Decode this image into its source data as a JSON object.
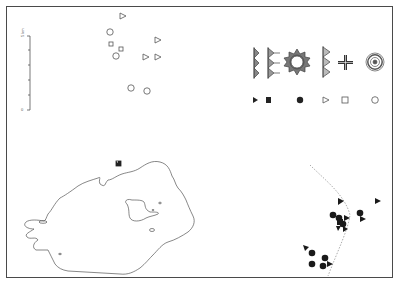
{
  "map": {
    "width": 396,
    "height": 283,
    "colors": {
      "ink": "#333333",
      "outline": "#555555",
      "frame": "#4a4a4a",
      "dashed_line": "#888888",
      "background": "#ffffff"
    },
    "scale_bar": {
      "top_label": "5 km",
      "bottom_label": "0",
      "ticks": 6
    },
    "legend": {
      "motifs": [
        {
          "name": "triangle-chain-single",
          "icon": "motif-triangle-column-icon"
        },
        {
          "name": "triangle-chain-double",
          "icon": "motif-double-triangle-column-icon"
        },
        {
          "name": "sun-rosette",
          "icon": "motif-sun-icon"
        },
        {
          "name": "triangle-chain-outlined",
          "icon": "motif-outlined-triangle-column-icon"
        },
        {
          "name": "cross",
          "icon": "motif-cross-icon"
        },
        {
          "name": "concentric-circles",
          "icon": "motif-concentric-circles-icon"
        }
      ],
      "markers": [
        {
          "symbol": "filled-triangle",
          "icon": "filled-triangle-icon"
        },
        {
          "symbol": "filled-square",
          "icon": "filled-square-icon"
        },
        {
          "symbol": "filled-circle",
          "icon": "filled-circle-icon"
        },
        {
          "symbol": "open-triangle",
          "icon": "open-triangle-icon"
        },
        {
          "symbol": "open-square",
          "icon": "open-square-icon"
        },
        {
          "symbol": "open-circle",
          "icon": "open-circle-icon"
        }
      ]
    },
    "open_points": [
      {
        "type": "triangle",
        "x": 122,
        "y": 16
      },
      {
        "type": "circle",
        "x": 110,
        "y": 32
      },
      {
        "type": "square",
        "x": 111,
        "y": 44
      },
      {
        "type": "square",
        "x": 121,
        "y": 49
      },
      {
        "type": "circle",
        "x": 116,
        "y": 56
      },
      {
        "type": "triangle",
        "x": 157,
        "y": 40
      },
      {
        "type": "triangle",
        "x": 145,
        "y": 57
      },
      {
        "type": "triangle",
        "x": 157,
        "y": 57
      },
      {
        "type": "circle",
        "x": 131,
        "y": 88
      },
      {
        "type": "circle",
        "x": 147,
        "y": 91
      }
    ],
    "filled_points": [
      {
        "type": "triangle",
        "x": 341,
        "y": 201
      },
      {
        "type": "circle",
        "x": 333,
        "y": 215
      },
      {
        "type": "circle",
        "x": 339,
        "y": 218
      },
      {
        "type": "square",
        "x": 340,
        "y": 222
      },
      {
        "type": "triangle",
        "x": 347,
        "y": 218
      },
      {
        "type": "circle",
        "x": 343,
        "y": 224
      },
      {
        "type": "triangle",
        "x": 338,
        "y": 228
      },
      {
        "type": "triangle",
        "x": 345,
        "y": 229
      },
      {
        "type": "circle",
        "x": 360,
        "y": 213
      },
      {
        "type": "triangle",
        "x": 363,
        "y": 219
      },
      {
        "type": "triangle",
        "x": 378,
        "y": 201
      },
      {
        "type": "triangle",
        "x": 306,
        "y": 248
      },
      {
        "type": "circle",
        "x": 312,
        "y": 253
      },
      {
        "type": "circle",
        "x": 312,
        "y": 264
      },
      {
        "type": "circle",
        "x": 325,
        "y": 258
      },
      {
        "type": "circle",
        "x": 323,
        "y": 266
      },
      {
        "type": "triangle",
        "x": 330,
        "y": 264
      }
    ],
    "island_marker": {
      "type": "half-filled-square",
      "x": 118,
      "y": 163
    }
  }
}
